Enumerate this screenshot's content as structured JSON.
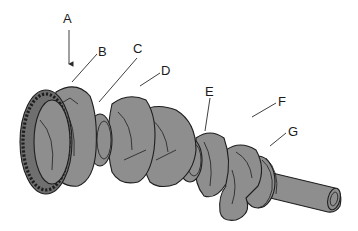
{
  "figure": {
    "callouts": [
      {
        "id": "A",
        "text": "A"
      },
      {
        "id": "B",
        "text": "B"
      },
      {
        "id": "C",
        "text": "C"
      },
      {
        "id": "D",
        "text": "D"
      },
      {
        "id": "E",
        "text": "E"
      },
      {
        "id": "F",
        "text": "F"
      },
      {
        "id": "G",
        "text": "G"
      }
    ]
  },
  "colors": {
    "background": "#ffffff",
    "metal_fill": "#8e8e8e",
    "outline": "#1e1e1e"
  }
}
